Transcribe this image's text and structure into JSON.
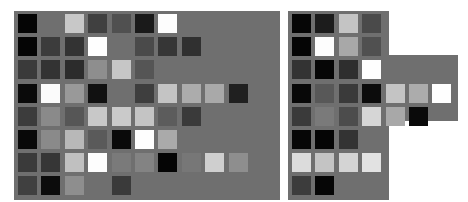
{
  "panel_color": "#6f6f6f",
  "layout": {
    "cell_size": 19,
    "pitch_x": 23.4,
    "pitch_y": 23.2,
    "left_origin_x": 18,
    "right_origin_x": 292,
    "origin_y": 14
  },
  "panels": [
    {
      "name": "left-panel",
      "x": 14,
      "y": 11,
      "w": 266,
      "h": 189
    },
    {
      "name": "right-panel-top",
      "x": 288,
      "y": 11,
      "w": 101,
      "h": 189
    },
    {
      "name": "right-panel-ext",
      "x": 288,
      "y": 55,
      "w": 170,
      "h": 66
    },
    {
      "name": "right-panel-mid",
      "x": 288,
      "y": 121,
      "w": 82,
      "h": 57
    }
  ],
  "left_grid": [
    [
      "#050505",
      null,
      "#c8c8c8",
      "#404040",
      "#505050",
      "#1a1a1a",
      "#fdfdfd",
      null,
      null,
      null
    ],
    [
      "#050505",
      "#3c3c3c",
      "#333333",
      "#fefefe",
      null,
      "#4a4a4a",
      "#363636",
      "#303030",
      null,
      null
    ],
    [
      "#3a3a3a",
      "#333333",
      "#2c2c2c",
      "#8e8e8e",
      "#c6c6c6",
      "#555555",
      null,
      null,
      null,
      null
    ],
    [
      "#0a0a0a",
      "#fbfbfb",
      "#999999",
      "#111111",
      null,
      "#3e3e3e",
      "#c4c4c4",
      "#acacac",
      "#a9a9a9",
      "#202020"
    ],
    [
      "#3c3c3c",
      "#8a8a8a",
      "#565656",
      "#c8c8c8",
      "#cacaca",
      "#c4c4c4",
      "#5c5c5c",
      "#3a3a3a",
      null,
      null
    ],
    [
      "#080808",
      "#8a8a8a",
      "#b8b8b8",
      "#5a5a5a",
      "#0a0a0a",
      "#fefefe",
      "#aaaaaa",
      null,
      null,
      null
    ],
    [
      "#3a3a3a",
      "#363636",
      "#c0c0c0",
      "#fdfdfd",
      "#7a7a7a",
      "#838383",
      "#050505",
      "#777777",
      "#cfcfcf",
      "#8e8e8e"
    ],
    [
      "#404040",
      "#0c0c0c",
      "#8e8e8e",
      null,
      "#3a3a3a",
      null,
      null,
      null,
      null,
      null
    ]
  ],
  "right_grid": [
    [
      "#060606",
      "#1c1c1c",
      "#c4c4c4",
      "#4a4a4a",
      null,
      null,
      null
    ],
    [
      "#050505",
      "#fdfdfd",
      "#a8a8a8",
      "#505050",
      null,
      null,
      null
    ],
    [
      "#333333",
      "#060606",
      "#2e2e2e",
      "#fefefe",
      null,
      null,
      null
    ],
    [
      "#080808",
      "#585858",
      "#3a3a3a",
      "#0c0c0c",
      "#c4c4c4",
      "#acacac",
      "#fefefe"
    ],
    [
      "#3a3a3a",
      "#7a7a7a",
      "#4c4c4c",
      "#d6d6d6",
      "#a8a8a8",
      "#0a0a0a",
      null
    ],
    [
      "#060606",
      "#050505",
      "#333333",
      null,
      null,
      null,
      null
    ],
    [
      "#dcdcdc",
      "#c4c4c4",
      "#d4d4d4",
      "#e2e2e2",
      null,
      null,
      null
    ],
    [
      "#3c3c3c",
      "#060606",
      null,
      null,
      null,
      null,
      null
    ]
  ]
}
